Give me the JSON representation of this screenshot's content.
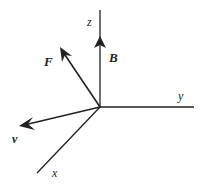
{
  "diagram": {
    "type": "vector-axes",
    "axes": {
      "x": {
        "label": "x"
      },
      "y": {
        "label": "y"
      },
      "z": {
        "label": "z"
      }
    },
    "vectors": {
      "B": {
        "label": "B",
        "direction": "+z"
      },
      "F": {
        "label": "F",
        "direction": "up-left"
      },
      "v": {
        "label": "v",
        "direction": "toward -y / x"
      }
    },
    "colors": {
      "stroke": "#222222",
      "background": "#ffffff"
    }
  }
}
